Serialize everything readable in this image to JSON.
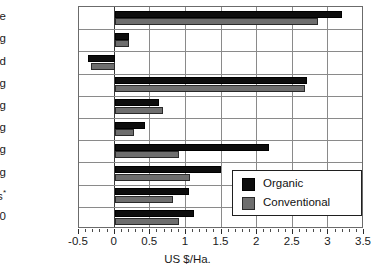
{
  "chart_data": {
    "type": "bar",
    "orientation": "horizontal",
    "title": "",
    "xlabel": "US $/Ha.",
    "ylabel": "",
    "xlim": [
      -0.5,
      3.5
    ],
    "xticks": [
      -0.5,
      0,
      0.5,
      1,
      1.5,
      2,
      2.5,
      3,
      3.5
    ],
    "xtick_labels": [
      "-0.5",
      "0",
      "0.5",
      "1",
      "1.5",
      "2",
      "2.5",
      "3",
      "3.5"
    ],
    "grid": true,
    "legend_position": "lower right",
    "categories": [
      "Cotton fibre",
      "Ginning",
      "Sale of seed",
      "Spinning",
      "Weaving",
      "Washing",
      "Dyeing",
      "Printing",
      "Losses*",
      "Total/10"
    ],
    "series": [
      {
        "name": "Organic",
        "color": "#0d0d0d",
        "values": [
          3.19,
          0.2,
          -0.37,
          2.7,
          0.62,
          0.42,
          2.17,
          1.49,
          1.05,
          1.12
        ]
      },
      {
        "name": "Conventional",
        "color": "#6e6e6e",
        "values": [
          2.85,
          0.2,
          -0.33,
          2.67,
          0.68,
          0.27,
          0.9,
          1.06,
          0.82,
          0.9
        ]
      }
    ],
    "footnote_marker": "*"
  },
  "legend": {
    "entries": [
      {
        "label": "Organic"
      },
      {
        "label": "Conventional"
      }
    ]
  }
}
